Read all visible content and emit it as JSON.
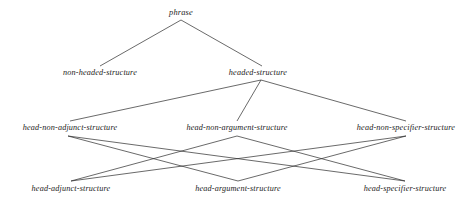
{
  "diagram": {
    "kind": "type-hierarchy-tree",
    "background_color": "#ffffff",
    "text_color": "#1b1b1b",
    "line_color": "#2a2a2a",
    "nodes": [
      {
        "id": "phrase",
        "label": "phrase",
        "x": 181,
        "y": 13,
        "level": 1
      },
      {
        "id": "non-headed-structure",
        "label": "non-headed-structure",
        "x": 100,
        "y": 73,
        "level": 2
      },
      {
        "id": "headed-structure",
        "label": "headed-structure",
        "x": 258,
        "y": 73,
        "level": 2
      },
      {
        "id": "head-non-adjunct-structure",
        "label": "head-non-adjunct-structure",
        "x": 70,
        "y": 128,
        "level": 3
      },
      {
        "id": "head-non-argument-structure",
        "label": "head-non-argument-structure",
        "x": 237,
        "y": 128,
        "level": 3
      },
      {
        "id": "head-non-specifier-structure",
        "label": "head-non-specifier-structure",
        "x": 406,
        "y": 128,
        "level": 3
      },
      {
        "id": "head-adjunct-structure",
        "label": "head-adjunct-structure",
        "x": 71,
        "y": 189,
        "level": 4
      },
      {
        "id": "head-argument-structure",
        "label": "head-argument-structure",
        "x": 238,
        "y": 189,
        "level": 4
      },
      {
        "id": "head-specifier-structure",
        "label": "head-specifier-structure",
        "x": 405,
        "y": 189,
        "level": 4
      }
    ],
    "edges": [
      {
        "from": "phrase",
        "to": "non-headed-structure",
        "x1": 181,
        "y1": 20,
        "x2": 100,
        "y2": 66
      },
      {
        "from": "phrase",
        "to": "headed-structure",
        "x1": 181,
        "y1": 20,
        "x2": 262,
        "y2": 66
      },
      {
        "from": "headed-structure",
        "to": "head-non-adjunct-structure",
        "x1": 261,
        "y1": 80,
        "x2": 70,
        "y2": 121
      },
      {
        "from": "headed-structure",
        "to": "head-non-argument-structure",
        "x1": 261,
        "y1": 80,
        "x2": 237,
        "y2": 121
      },
      {
        "from": "headed-structure",
        "to": "head-non-specifier-structure",
        "x1": 261,
        "y1": 80,
        "x2": 406,
        "y2": 121
      },
      {
        "from": "head-non-adjunct-structure",
        "to": "head-argument-structure",
        "x1": 68,
        "y1": 136,
        "x2": 238,
        "y2": 181
      },
      {
        "from": "head-non-adjunct-structure",
        "to": "head-specifier-structure",
        "x1": 68,
        "y1": 136,
        "x2": 405,
        "y2": 181
      },
      {
        "from": "head-non-argument-structure",
        "to": "head-adjunct-structure",
        "x1": 237,
        "y1": 136,
        "x2": 71,
        "y2": 181
      },
      {
        "from": "head-non-argument-structure",
        "to": "head-specifier-structure",
        "x1": 237,
        "y1": 136,
        "x2": 405,
        "y2": 181
      },
      {
        "from": "head-non-specifier-structure",
        "to": "head-adjunct-structure",
        "x1": 406,
        "y1": 136,
        "x2": 71,
        "y2": 181
      },
      {
        "from": "head-non-specifier-structure",
        "to": "head-argument-structure",
        "x1": 406,
        "y1": 136,
        "x2": 238,
        "y2": 181
      }
    ]
  }
}
